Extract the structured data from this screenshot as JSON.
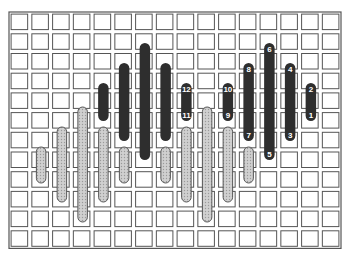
{
  "diagram": {
    "grid": {
      "columns": 16,
      "rows": 12,
      "origin": [
        9,
        12
      ],
      "cell_w": 20.75,
      "cell_h": 19.7,
      "line_color": "#555555",
      "gap_color": "#ffffff"
    },
    "colors": {
      "dark_stitch": "#2e2e2e",
      "light_stitch": "#c8c8c8",
      "light_stitch_outline": "#555555",
      "label_text": "#ffffff"
    },
    "light_stitches": [
      {
        "col": 1,
        "y1": 147,
        "y2": 183
      },
      {
        "col": 2,
        "y1": 127,
        "y2": 202
      },
      {
        "col": 3,
        "y1": 107,
        "y2": 222
      },
      {
        "col": 4,
        "y1": 127,
        "y2": 202
      },
      {
        "col": 5,
        "y1": 147,
        "y2": 183
      },
      {
        "col": 7,
        "y1": 147,
        "y2": 183
      },
      {
        "col": 8,
        "y1": 127,
        "y2": 202
      },
      {
        "col": 9,
        "y1": 107,
        "y2": 222
      },
      {
        "col": 10,
        "y1": 127,
        "y2": 202
      },
      {
        "col": 11,
        "y1": 147,
        "y2": 183
      }
    ],
    "dark_stitches": [
      {
        "col": 4,
        "y1": 83,
        "y2": 121
      },
      {
        "col": 5,
        "y1": 63,
        "y2": 141
      },
      {
        "col": 6,
        "y1": 43,
        "y2": 160
      },
      {
        "col": 7,
        "y1": 63,
        "y2": 141
      },
      {
        "col": 8,
        "y1": 83,
        "y2": 121,
        "top_label": "12",
        "bottom_label": "11"
      },
      {
        "col": 10,
        "y1": 83,
        "y2": 121,
        "top_label": "10",
        "bottom_label": "9"
      },
      {
        "col": 11,
        "y1": 63,
        "y2": 141,
        "top_label": "8",
        "bottom_label": "7"
      },
      {
        "col": 12,
        "y1": 43,
        "y2": 160,
        "top_label": "6",
        "bottom_label": "5"
      },
      {
        "col": 13,
        "y1": 63,
        "y2": 141,
        "top_label": "4",
        "bottom_label": "3"
      },
      {
        "col": 14,
        "y1": 83,
        "y2": 121,
        "top_label": "2",
        "bottom_label": "1"
      }
    ]
  }
}
